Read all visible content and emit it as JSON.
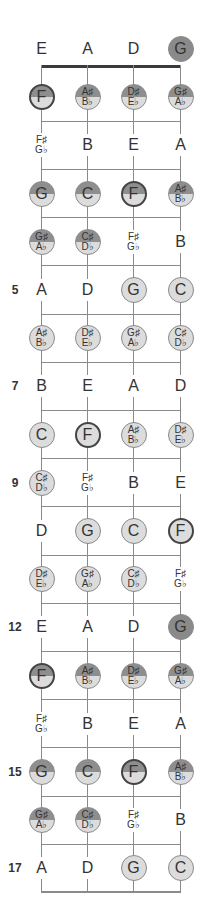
{
  "diagram": {
    "strings": [
      "E",
      "A",
      "D",
      "G"
    ],
    "columns_x": [
      41,
      87,
      133,
      180
    ],
    "row_start_y": 49,
    "row_step": 48.2,
    "colors": {
      "line": "#8a8a8a",
      "nut": "#3a3a3a",
      "light": "#dcdcdc",
      "dark": "#8e8e8e",
      "text": "#333333"
    },
    "rows": [
      {
        "fret": "",
        "notes": [
          {
            "label": "E",
            "style": "plain"
          },
          {
            "label": "A",
            "style": "plain"
          },
          {
            "label": "D",
            "style": "plain"
          },
          {
            "label": "G",
            "style": "dark"
          }
        ]
      },
      {
        "fret": "",
        "notes": [
          {
            "label": "F",
            "style": "split",
            "root": true
          },
          {
            "label": "A♯",
            "label2": "B♭",
            "style": "split"
          },
          {
            "label": "D♯",
            "label2": "E♭",
            "style": "split"
          },
          {
            "label": "G♯",
            "label2": "A♭",
            "style": "split"
          }
        ]
      },
      {
        "fret": "",
        "notes": [
          {
            "label": "F♯",
            "label2": "G♭",
            "style": "plain"
          },
          {
            "label": "B",
            "style": "plain"
          },
          {
            "label": "E",
            "style": "plain"
          },
          {
            "label": "A",
            "style": "plain"
          }
        ]
      },
      {
        "fret": "",
        "notes": [
          {
            "label": "G",
            "style": "split"
          },
          {
            "label": "C",
            "style": "split"
          },
          {
            "label": "F",
            "style": "split",
            "root": true
          },
          {
            "label": "A♯",
            "label2": "B♭",
            "style": "split"
          }
        ]
      },
      {
        "fret": "",
        "notes": [
          {
            "label": "G♯",
            "label2": "A♭",
            "style": "split"
          },
          {
            "label": "C♯",
            "label2": "D♭",
            "style": "split"
          },
          {
            "label": "F♯",
            "label2": "G♭",
            "style": "plain"
          },
          {
            "label": "B",
            "style": "plain"
          }
        ]
      },
      {
        "fret": "5",
        "notes": [
          {
            "label": "A",
            "style": "plain"
          },
          {
            "label": "D",
            "style": "plain"
          },
          {
            "label": "G",
            "style": "light"
          },
          {
            "label": "C",
            "style": "light"
          }
        ]
      },
      {
        "fret": "",
        "notes": [
          {
            "label": "A♯",
            "label2": "B♭",
            "style": "light"
          },
          {
            "label": "D♯",
            "label2": "E♭",
            "style": "light"
          },
          {
            "label": "G♯",
            "label2": "A♭",
            "style": "light"
          },
          {
            "label": "C♯",
            "label2": "D♭",
            "style": "light"
          }
        ]
      },
      {
        "fret": "7",
        "notes": [
          {
            "label": "B",
            "style": "plain"
          },
          {
            "label": "E",
            "style": "plain"
          },
          {
            "label": "A",
            "style": "plain"
          },
          {
            "label": "D",
            "style": "plain"
          }
        ]
      },
      {
        "fret": "",
        "notes": [
          {
            "label": "C",
            "style": "light"
          },
          {
            "label": "F",
            "style": "light",
            "root": true
          },
          {
            "label": "A♯",
            "label2": "B♭",
            "style": "light"
          },
          {
            "label": "D♯",
            "label2": "E♭",
            "style": "light"
          }
        ]
      },
      {
        "fret": "9",
        "notes": [
          {
            "label": "C♯",
            "label2": "D♭",
            "style": "light"
          },
          {
            "label": "F♯",
            "label2": "G♭",
            "style": "plain"
          },
          {
            "label": "B",
            "style": "plain"
          },
          {
            "label": "E",
            "style": "plain"
          }
        ]
      },
      {
        "fret": "",
        "notes": [
          {
            "label": "D",
            "style": "plain"
          },
          {
            "label": "G",
            "style": "light"
          },
          {
            "label": "C",
            "style": "light"
          },
          {
            "label": "F",
            "style": "light",
            "root": true
          }
        ]
      },
      {
        "fret": "",
        "notes": [
          {
            "label": "D♯",
            "label2": "E♭",
            "style": "light"
          },
          {
            "label": "G♯",
            "label2": "A♭",
            "style": "light"
          },
          {
            "label": "C♯",
            "label2": "D♭",
            "style": "light"
          },
          {
            "label": "F♯",
            "label2": "G♭",
            "style": "plain"
          }
        ]
      },
      {
        "fret": "12",
        "notes": [
          {
            "label": "E",
            "style": "plain"
          },
          {
            "label": "A",
            "style": "plain"
          },
          {
            "label": "D",
            "style": "plain"
          },
          {
            "label": "G",
            "style": "dark"
          }
        ]
      },
      {
        "fret": "",
        "notes": [
          {
            "label": "F",
            "style": "split",
            "root": true
          },
          {
            "label": "A♯",
            "label2": "B♭",
            "style": "split"
          },
          {
            "label": "D♯",
            "label2": "E♭",
            "style": "split"
          },
          {
            "label": "G♯",
            "label2": "A♭",
            "style": "split"
          }
        ]
      },
      {
        "fret": "",
        "notes": [
          {
            "label": "F♯",
            "label2": "G♭",
            "style": "plain"
          },
          {
            "label": "B",
            "style": "plain"
          },
          {
            "label": "E",
            "style": "plain"
          },
          {
            "label": "A",
            "style": "plain"
          }
        ]
      },
      {
        "fret": "15",
        "notes": [
          {
            "label": "G",
            "style": "split"
          },
          {
            "label": "C",
            "style": "split"
          },
          {
            "label": "F",
            "style": "split",
            "root": true
          },
          {
            "label": "A♯",
            "label2": "B♭",
            "style": "split"
          }
        ]
      },
      {
        "fret": "",
        "notes": [
          {
            "label": "G♯",
            "label2": "A♭",
            "style": "split"
          },
          {
            "label": "C♯",
            "label2": "D♭",
            "style": "split"
          },
          {
            "label": "F♯",
            "label2": "G♭",
            "style": "plain"
          },
          {
            "label": "B",
            "style": "plain"
          }
        ]
      },
      {
        "fret": "17",
        "notes": [
          {
            "label": "A",
            "style": "plain"
          },
          {
            "label": "D",
            "style": "plain"
          },
          {
            "label": "G",
            "style": "light"
          },
          {
            "label": "C",
            "style": "light"
          }
        ]
      }
    ]
  }
}
